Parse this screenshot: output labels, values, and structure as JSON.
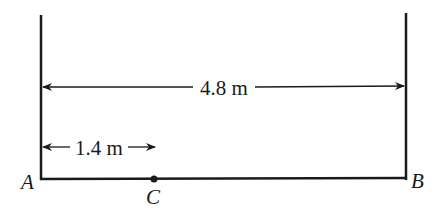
{
  "diagram": {
    "points": {
      "A": {
        "label": "A"
      },
      "B": {
        "label": "B"
      },
      "C": {
        "label": "C"
      }
    },
    "dimensions": {
      "total": {
        "label": "4.8 m",
        "value": 4.8,
        "unit": "m",
        "from": "A",
        "to": "B"
      },
      "ac": {
        "label": "1.4 m",
        "value": 1.4,
        "unit": "m",
        "from": "A",
        "to": "C"
      }
    },
    "colors": {
      "line": "#1a1a1a",
      "background": "#ffffff"
    }
  }
}
